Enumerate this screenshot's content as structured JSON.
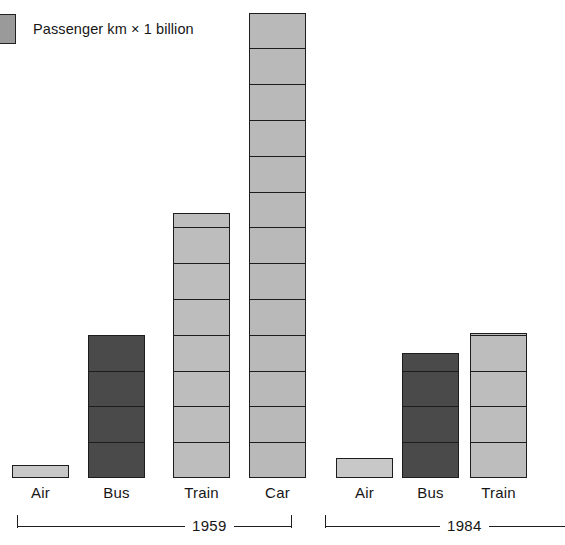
{
  "top_caption": "",
  "legend": {
    "swatch_name": "unit-block-swatch",
    "swatch_color": "#9a9a9a",
    "label": "Passenger km × 1 billion"
  },
  "colors": {
    "air": "#c8c8c8",
    "bus": "#4a4a4a",
    "train": "#bdbdbd",
    "car": "#b9b9b9",
    "outline": "#1d1d1d",
    "background": "#ffffff"
  },
  "groups": [
    {
      "id": "g1959",
      "year": "1959"
    },
    {
      "id": "g1984",
      "year": "1984"
    }
  ],
  "bars": [
    {
      "id": "air-1959",
      "label": "Air",
      "group": "1959",
      "units": 0.35,
      "color": "#c8c8c8",
      "segments": 1
    },
    {
      "id": "bus-1959",
      "label": "Bus",
      "group": "1959",
      "units": 4.0,
      "color": "#4a4a4a",
      "segments": 4
    },
    {
      "id": "train-1959",
      "label": "Train",
      "group": "1959",
      "units": 7.4,
      "color": "#bdbdbd",
      "segments": 8
    },
    {
      "id": "car-1959",
      "label": "Car",
      "group": "1959",
      "units": 13.0,
      "color": "#b9b9b9",
      "segments": 13
    },
    {
      "id": "air-1984",
      "label": "Air",
      "group": "1984",
      "units": 0.55,
      "color": "#c8c8c8",
      "segments": 1
    },
    {
      "id": "bus-1984",
      "label": "Bus",
      "group": "1984",
      "units": 3.5,
      "color": "#4a4a4a",
      "segments": 4
    },
    {
      "id": "train-1984",
      "label": "Train",
      "group": "1984",
      "units": 4.05,
      "color": "#bdbdbd",
      "segments": 5
    }
  ],
  "chart_data": {
    "type": "bar",
    "title": "",
    "subtitle": "",
    "xlabel": "",
    "ylabel": "Passenger km × 1 billion",
    "unit_note": "Each stacked block = 1 billion passenger km",
    "grid": false,
    "legend_position": "top-left",
    "legend_entries": [
      "Passenger km × 1 billion"
    ],
    "groups": [
      "1959",
      "1984"
    ],
    "categories": [
      "Air",
      "Bus",
      "Train",
      "Car"
    ],
    "series": [
      {
        "name": "1959",
        "categories": [
          "Air",
          "Bus",
          "Train",
          "Car"
        ],
        "values": [
          0.35,
          4.0,
          7.4,
          13.0
        ]
      },
      {
        "name": "1984",
        "categories": [
          "Air",
          "Bus",
          "Train",
          "Car"
        ],
        "values": [
          0.55,
          3.5,
          4.05,
          null
        ]
      }
    ],
    "notes": [
      "The 1984 'Car' bar is cropped out of the right edge of the image.",
      "Bar heights are read as counts of unit blocks; each block = 1 billion passenger km.",
      "Air bars are thin slivers well under one full block.",
      "Bus bars are rendered dark grey; Train and Car bars are rendered light grey."
    ],
    "ylim": [
      0,
      13.5
    ],
    "unit_block_value": 1
  }
}
